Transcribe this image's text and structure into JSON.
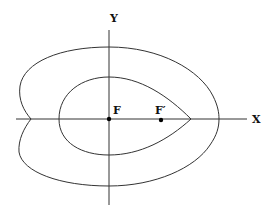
{
  "diagram": {
    "axes": {
      "x_label": "X",
      "y_label": "Y"
    },
    "points": [
      {
        "label": "F",
        "desc": "focus at origin"
      },
      {
        "label": "F′",
        "desc": "second focus on x-axis"
      }
    ],
    "curves": [
      "outer-oval-with-dimple",
      "inner-egg-oval"
    ],
    "colors": {
      "line": "#333333",
      "point": "#000000",
      "background": "#ffffff"
    }
  }
}
